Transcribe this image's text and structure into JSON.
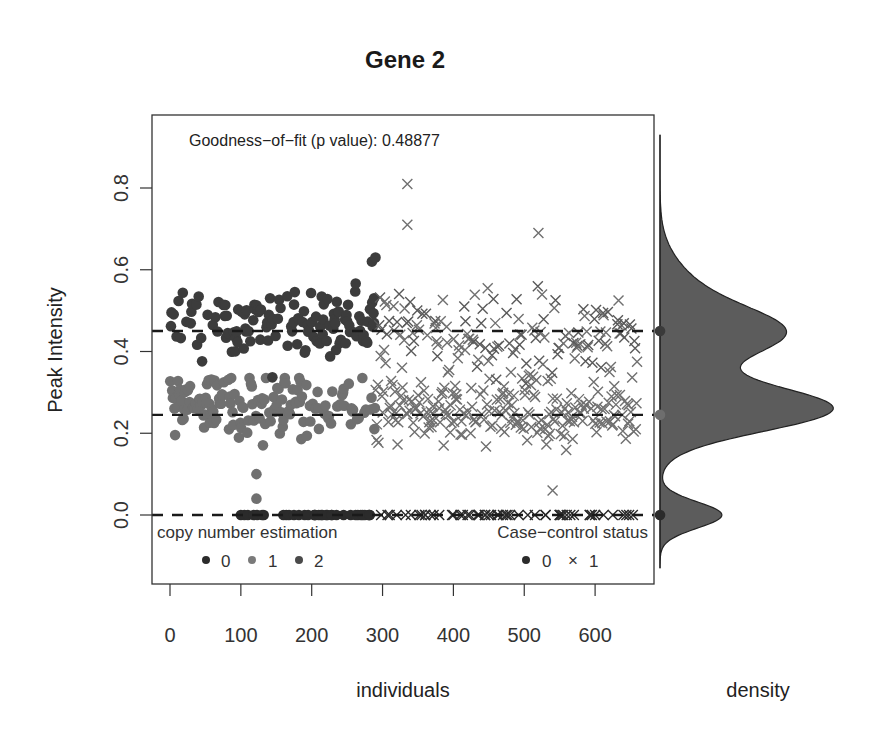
{
  "chart_data": {
    "type": "scatter",
    "title": "Gene 2",
    "xlabel": "individuals",
    "ylabel": "Peak Intensity",
    "side_panel_label": "density",
    "annotation": "Goodness-of-fit (p value): 0.48877",
    "xlim": [
      -25,
      680
    ],
    "ylim": [
      -0.145,
      0.9
    ],
    "x_ticks": [
      0,
      100,
      200,
      300,
      400,
      500,
      600
    ],
    "y_ticks": [
      0.0,
      0.2,
      0.4,
      0.6,
      0.8
    ],
    "y_tick_labels": [
      "0.0",
      "0.2",
      "0.4",
      "0.6",
      "0.8"
    ],
    "grid": false,
    "reference_lines": [
      {
        "copy_number": 0,
        "y": 0.0,
        "style": "dashed",
        "color": "#1a1a1a"
      },
      {
        "copy_number": 1,
        "y": 0.245,
        "style": "dashed",
        "color": "#1a1a1a"
      },
      {
        "copy_number": 2,
        "y": 0.45,
        "style": "dashed",
        "color": "#1a1a1a"
      }
    ],
    "series": [
      {
        "name": "copy number 0",
        "marker": "circle",
        "color": "#2b2b2b",
        "y_center": 0.0,
        "y_spread": 0.0,
        "note": "points along y=0 spanning x~100-660"
      },
      {
        "name": "copy number 1",
        "marker": "mixed",
        "color": "#6e6e6e",
        "y_center": 0.25,
        "y_spread": 0.06,
        "note": "lower cluster ~0.1-0.33"
      },
      {
        "name": "copy number 2",
        "marker": "mixed",
        "color": "#3a3a3a",
        "y_center": 0.47,
        "y_spread": 0.07,
        "note": "upper cluster ~0.33-0.62"
      }
    ],
    "case_control": [
      {
        "status": "0",
        "marker": "circle",
        "x_range": [
          0,
          290
        ]
      },
      {
        "status": "1",
        "marker": "cross",
        "x_range": [
          290,
          660
        ]
      }
    ],
    "notable_points": [
      {
        "x": 335,
        "y": 0.81,
        "marker": "cross"
      },
      {
        "x": 335,
        "y": 0.71,
        "marker": "cross"
      },
      {
        "x": 520,
        "y": 0.69,
        "marker": "cross"
      },
      {
        "x": 122,
        "y": 0.1,
        "marker": "circle"
      },
      {
        "x": 122,
        "y": 0.04,
        "marker": "circle"
      },
      {
        "x": 540,
        "y": 0.06,
        "marker": "cross"
      }
    ],
    "density": {
      "orientation": "horizontal",
      "fill": "#5a5a5a",
      "peaks": [
        {
          "y": 0.0,
          "relative_height": 0.36
        },
        {
          "y": 0.26,
          "relative_height": 1.0
        },
        {
          "y": 0.45,
          "relative_height": 0.63
        }
      ],
      "markers": [
        {
          "y": 0.45,
          "color": "#3a3a3a"
        },
        {
          "y": 0.245,
          "color": "#6e6e6e"
        },
        {
          "y": 0.0,
          "color": "#2b2b2b"
        }
      ]
    },
    "legends": [
      {
        "title": "copy number estimation",
        "position": "bottom-left",
        "entries": [
          {
            "label": "0",
            "color": "#2b2b2b",
            "marker": "circle"
          },
          {
            "label": "1",
            "color": "#7a7a7a",
            "marker": "circle"
          },
          {
            "label": "2",
            "color": "#4a4a4a",
            "marker": "circle"
          }
        ]
      },
      {
        "title": "Case−control status",
        "position": "bottom-right",
        "entries": [
          {
            "label": "0",
            "marker": "circle"
          },
          {
            "label": "1",
            "marker": "cross"
          }
        ]
      }
    ]
  },
  "labels": {
    "title": "Gene 2",
    "annotation": "Goodness−of−fit (p value): 0.48877",
    "xlabel": "individuals",
    "ylabel": "Peak Intensity",
    "density_label": "density",
    "legend_cn_title": "copy number estimation",
    "legend_cn_0": "0",
    "legend_cn_1": "1",
    "legend_cn_2": "2",
    "legend_cc_title": "Case−control status",
    "legend_cc_0": "0",
    "legend_cc_1": "1",
    "legend_cc_cross": "×"
  }
}
